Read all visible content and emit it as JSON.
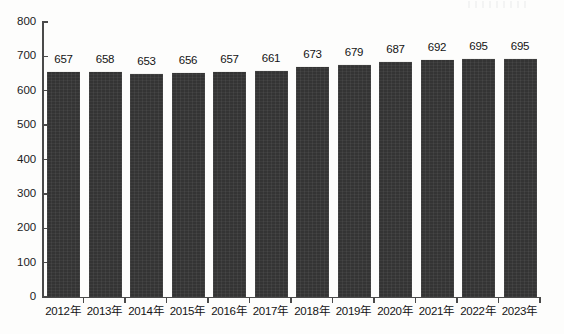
{
  "chart_data": {
    "type": "bar",
    "title": "",
    "subtitle": "",
    "xlabel": "",
    "ylabel": "",
    "categories": [
      "2012年",
      "2013年",
      "2014年",
      "2015年",
      "2016年",
      "2017年",
      "2018年",
      "2019年",
      "2020年",
      "2021年",
      "2022年",
      "2023年"
    ],
    "values": [
      657,
      658,
      653,
      656,
      657,
      661,
      673,
      679,
      687,
      692,
      695,
      695
    ],
    "series": [
      {
        "name": "",
        "values": [
          657,
          658,
          653,
          656,
          657,
          661,
          673,
          679,
          687,
          692,
          695,
          695
        ]
      }
    ],
    "ylim": [
      0,
      800
    ],
    "ytick_labels": [
      "800",
      "700",
      "600",
      "500",
      "400",
      "300",
      "200",
      "100",
      "0"
    ],
    "ytick_values": [
      800,
      700,
      600,
      500,
      400,
      300,
      200,
      100,
      0
    ],
    "grid": false,
    "legend": null,
    "legend_position": "none",
    "data_labels_shown": true,
    "colors": {
      "bar": "#343434",
      "bar_top_edge": "#f2f2f0",
      "axis": "#4a4a4a",
      "text": "#141414",
      "background": "#fdfdfc"
    }
  }
}
